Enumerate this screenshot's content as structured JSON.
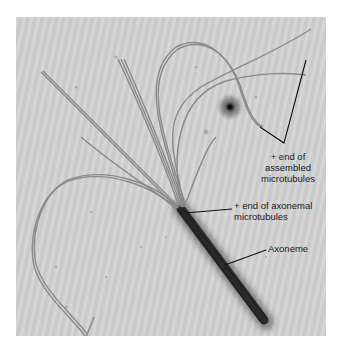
{
  "figure": {
    "labels": {
      "assembled": {
        "line1": "+ end of",
        "line2": "assembled",
        "line3": "microtubules"
      },
      "axonemal": {
        "line1": "+ end of axonemal",
        "line2": "microtubules"
      },
      "axoneme": "Axoneme"
    },
    "colors": {
      "background": "#c9c9c9",
      "filament": "#8a8a8a",
      "axoneme": "#2e2e2e",
      "leader_line": "#111111",
      "page": "#ffffff"
    }
  }
}
